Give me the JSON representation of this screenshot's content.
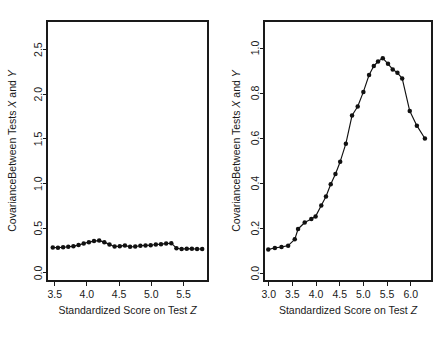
{
  "figure": {
    "background_color": "#ffffff",
    "foreground_color": "#1a1a1a",
    "panel_count": 2
  },
  "chart_data": [
    {
      "panel": "left",
      "type": "line",
      "title": "",
      "xlabel_parts": {
        "text": "Standardized Score on Test ",
        "italic_symbol": "Z"
      },
      "ylabel_parts": {
        "text": "CovarianceBetween Tests ",
        "italic_symbol_1": "X",
        "text_mid": " and ",
        "italic_symbol_2": "Y"
      },
      "xlabel": "Standardized Score on Test Z",
      "ylabel": "CovarianceBetween Tests X and Y",
      "xlim": [
        3.38,
        5.88
      ],
      "ylim": [
        -0.09,
        2.82
      ],
      "xticks": [
        3.5,
        4.0,
        4.5,
        5.0,
        5.5
      ],
      "xticklabels": [
        "3.5",
        "4.0",
        "4.5",
        "5.0",
        "5.5"
      ],
      "yticks": [
        0.0,
        0.5,
        1.0,
        1.5,
        2.0,
        2.5
      ],
      "yticklabels": [
        "0.0",
        "0.5",
        "1.0",
        "1.5",
        "2.0",
        "2.5"
      ],
      "grid": false,
      "legend": null,
      "marker": "filled-circle",
      "x": [
        3.47,
        3.55,
        3.63,
        3.71,
        3.79,
        3.87,
        3.95,
        4.03,
        4.11,
        4.19,
        4.27,
        4.35,
        4.43,
        4.51,
        4.59,
        4.67,
        4.75,
        4.83,
        4.91,
        4.99,
        5.07,
        5.15,
        5.23,
        5.31,
        5.39,
        5.47,
        5.55,
        5.63,
        5.71,
        5.79
      ],
      "y": [
        0.285,
        0.283,
        0.288,
        0.293,
        0.3,
        0.312,
        0.33,
        0.345,
        0.357,
        0.362,
        0.345,
        0.318,
        0.297,
        0.3,
        0.308,
        0.292,
        0.296,
        0.305,
        0.308,
        0.31,
        0.318,
        0.322,
        0.33,
        0.333,
        0.277,
        0.268,
        0.272,
        0.27,
        0.268,
        0.268
      ]
    },
    {
      "panel": "right",
      "type": "line",
      "title": "",
      "xlabel_parts": {
        "text": "Standardized Score on Test ",
        "italic_symbol": "Z"
      },
      "ylabel_parts": {
        "text": "CovarianceBetween Tests ",
        "italic_symbol_1": "X",
        "text_mid": " and ",
        "italic_symbol_2": "Y"
      },
      "xlabel": "Standardized Score on Test Z",
      "ylabel": "CovarianceBetween Tests X and Y",
      "xlim": [
        2.9,
        6.45
      ],
      "ylim": [
        -0.035,
        1.12
      ],
      "xticks": [
        3.0,
        3.5,
        4.0,
        4.5,
        5.0,
        5.5,
        6.0
      ],
      "xticklabels": [
        "3.0",
        "3.5",
        "4.0",
        "4.5",
        "5.0",
        "5.5",
        "6.0"
      ],
      "yticks": [
        0.0,
        0.2,
        0.4,
        0.6,
        0.8,
        1.0
      ],
      "yticklabels": [
        "0.0",
        "0.2",
        "0.4",
        "0.6",
        "0.8",
        "1.0"
      ],
      "grid": false,
      "legend": null,
      "marker": "filled-circle",
      "x": [
        2.99,
        3.13,
        3.27,
        3.41,
        3.55,
        3.62,
        3.76,
        3.9,
        3.99,
        4.11,
        4.21,
        4.31,
        4.41,
        4.51,
        4.63,
        4.76,
        4.88,
        5.0,
        5.12,
        5.22,
        5.31,
        5.41,
        5.52,
        5.62,
        5.72,
        5.82,
        5.98,
        6.13,
        6.3
      ],
      "y": [
        0.105,
        0.112,
        0.116,
        0.122,
        0.15,
        0.196,
        0.225,
        0.24,
        0.252,
        0.3,
        0.34,
        0.395,
        0.44,
        0.495,
        0.575,
        0.7,
        0.74,
        0.805,
        0.88,
        0.92,
        0.94,
        0.955,
        0.93,
        0.905,
        0.89,
        0.865,
        0.72,
        0.655,
        0.598
      ]
    }
  ]
}
